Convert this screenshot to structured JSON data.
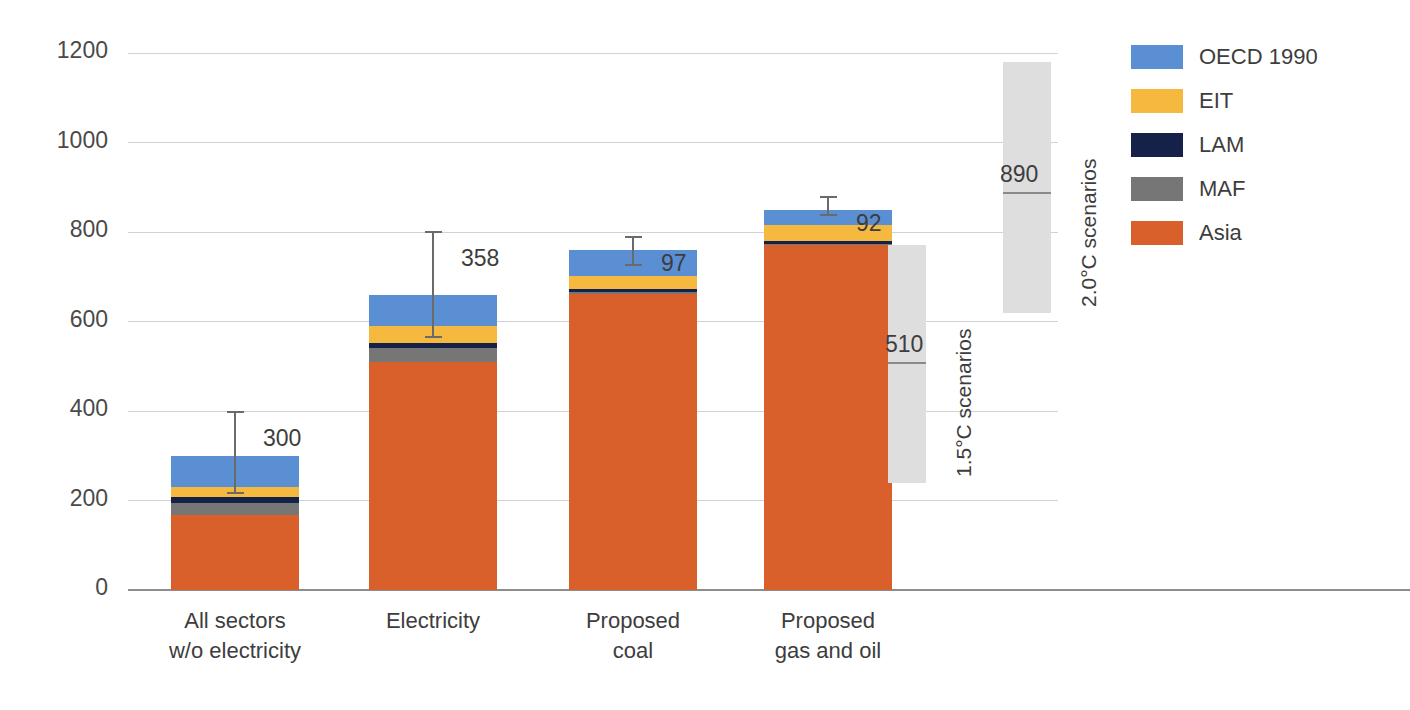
{
  "chart_data": {
    "type": "bar",
    "title": "",
    "subtitle": "",
    "xlabel": "",
    "ylabel": "Cumulative emissions (GtCO2)",
    "ylabel_prefix": "Cumulative emissions (GtCO",
    "ylabel_sub": "2",
    "ylabel_suffix": ")",
    "ylim": [
      0,
      1200
    ],
    "yticks": [
      0,
      200,
      400,
      600,
      800,
      1000,
      1200
    ],
    "ytick_labels": [
      "0",
      "200",
      "400",
      "600",
      "800",
      "1000",
      "1200"
    ],
    "grid": "horizontal",
    "legend_position": "right",
    "stacked": true,
    "categories": [
      "All sectors w/o electricity",
      "Electricity",
      "Proposed coal",
      "Proposed gas and oil"
    ],
    "category_lines": [
      [
        "All sectors",
        "w/o electricity"
      ],
      [
        "Electricity",
        ""
      ],
      [
        "Proposed",
        "coal"
      ],
      [
        "Proposed",
        "gas and oil"
      ]
    ],
    "series": [
      {
        "name": "Asia",
        "color": "#d9602a",
        "values": [
          168,
          510,
          662,
          770
        ]
      },
      {
        "name": "MAF",
        "color": "#767676",
        "values": [
          27,
          30,
          4,
          3
        ]
      },
      {
        "name": "LAM",
        "color": "#16214a",
        "values": [
          13,
          13,
          7,
          8
        ]
      },
      {
        "name": "EIT",
        "color": "#f6b93f",
        "values": [
          23,
          38,
          29,
          34
        ]
      },
      {
        "name": "OECD 1990",
        "color": "#5b8fd4",
        "values": [
          69,
          69,
          58,
          35
        ]
      }
    ],
    "totals": [
      300,
      660,
      760,
      850
    ],
    "annotations": [
      {
        "label": "300",
        "value": 300,
        "range": [
          215,
          400
        ],
        "category": "All sectors w/o electricity"
      },
      {
        "label": "358",
        "value": 358,
        "range": [
          563,
          802
        ],
        "category": "Electricity"
      },
      {
        "label": "97",
        "value": 97,
        "range": [
          723,
          790
        ],
        "category": "Proposed coal"
      },
      {
        "label": "92",
        "value": 92,
        "range": [
          836,
          880
        ],
        "category": "Proposed gas and oil"
      }
    ],
    "scenario_boxes": [
      {
        "name": "1.5°C scenarios",
        "label": "1.5°C scenarios",
        "value": 510,
        "value_label": "510",
        "range": [
          240,
          770
        ],
        "color": "#dedede"
      },
      {
        "name": "2.0°C scenarios",
        "label": "2.0°C scenarios",
        "value": 890,
        "value_label": "890",
        "range": [
          620,
          1180
        ],
        "color": "#dedede"
      }
    ]
  },
  "legend": {
    "items": [
      {
        "label": "OECD 1990",
        "color": "#5b8fd4"
      },
      {
        "label": "EIT",
        "color": "#f6b93f"
      },
      {
        "label": "LAM",
        "color": "#16214a"
      },
      {
        "label": "MAF",
        "color": "#767676"
      },
      {
        "label": "Asia",
        "color": "#d9602a"
      }
    ]
  },
  "colors": {
    "grid": "#d2d2d2",
    "axis": "#8d8d8d",
    "text": "#3d3d3d",
    "errorbar": "#6a6a6a",
    "scenario": "#dedede",
    "background": "#ffffff"
  }
}
